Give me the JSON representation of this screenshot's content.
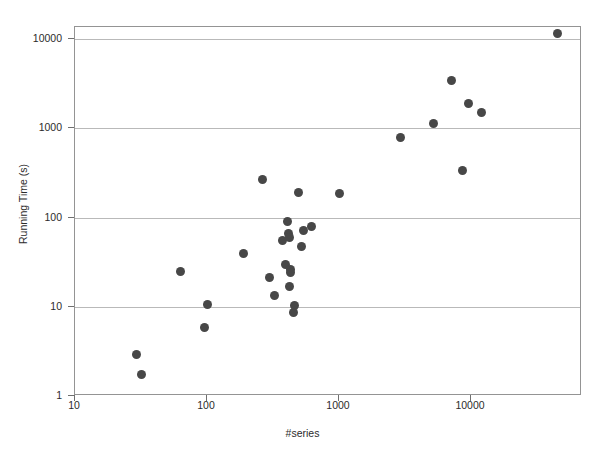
{
  "chart_data": {
    "type": "scatter",
    "title": "",
    "xlabel": "#series",
    "ylabel": "Running Time (s)",
    "xscale": "log",
    "yscale": "log",
    "xlim": [
      10,
      50000
    ],
    "ylim": [
      1,
      18000
    ],
    "xticks": [
      10,
      100,
      1000,
      10000
    ],
    "xtick_labels": [
      "10",
      "100",
      "1000",
      "10000"
    ],
    "yticks": [
      1,
      10,
      100,
      1000,
      10000
    ],
    "ytick_labels": [
      "1",
      "10",
      "100",
      "1000",
      "10000"
    ],
    "grid": "horizontal",
    "legend": "none",
    "marker_color": "#474747",
    "marker_size": 9,
    "points": [
      {
        "x": 29,
        "y": 2.9
      },
      {
        "x": 32,
        "y": 1.75
      },
      {
        "x": 63,
        "y": 25
      },
      {
        "x": 96,
        "y": 5.9
      },
      {
        "x": 101,
        "y": 10.5
      },
      {
        "x": 190,
        "y": 40
      },
      {
        "x": 265,
        "y": 265
      },
      {
        "x": 296,
        "y": 21
      },
      {
        "x": 322,
        "y": 13.5
      },
      {
        "x": 372,
        "y": 55
      },
      {
        "x": 395,
        "y": 30
      },
      {
        "x": 405,
        "y": 90
      },
      {
        "x": 415,
        "y": 66
      },
      {
        "x": 420,
        "y": 60
      },
      {
        "x": 423,
        "y": 17
      },
      {
        "x": 429,
        "y": 26
      },
      {
        "x": 432,
        "y": 24
      },
      {
        "x": 449,
        "y": 8.6
      },
      {
        "x": 460,
        "y": 10.2
      },
      {
        "x": 490,
        "y": 192
      },
      {
        "x": 520,
        "y": 47
      },
      {
        "x": 535,
        "y": 72
      },
      {
        "x": 620,
        "y": 80
      },
      {
        "x": 1000,
        "y": 185
      },
      {
        "x": 2900,
        "y": 790
      },
      {
        "x": 5200,
        "y": 1130
      },
      {
        "x": 7100,
        "y": 3450
      },
      {
        "x": 8600,
        "y": 340
      },
      {
        "x": 9500,
        "y": 1900
      },
      {
        "x": 12000,
        "y": 1500
      },
      {
        "x": 45000,
        "y": 11500
      }
    ]
  }
}
